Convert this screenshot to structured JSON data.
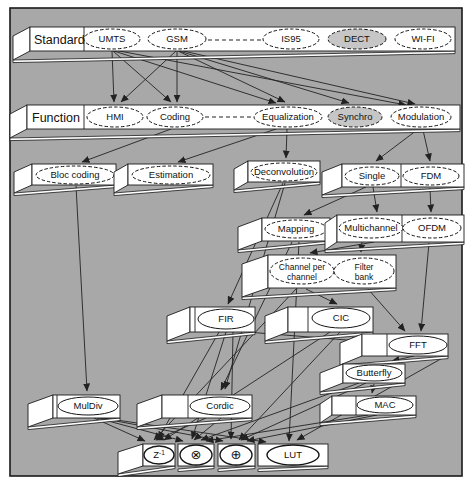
{
  "figure": {
    "panel": {
      "x": 10,
      "y": 8,
      "w": 452,
      "h": 468,
      "fill": "#a8a8a8",
      "border": "#1a1a1a"
    },
    "colors": {
      "bar_fill": "#ffffff",
      "bar_border": "#1c1c1c",
      "node_fill": "#ffffff",
      "node_shaded": "#c6c6c6",
      "line": "#222222"
    },
    "bars": [
      {
        "name": "standard-band",
        "label": "Standard",
        "label_x": 34,
        "x": 30,
        "y": 27,
        "w": 425,
        "h": 24,
        "flap": [
          17,
          9
        ],
        "dividers": [
          84
        ],
        "nodes": [
          {
            "name": "umts",
            "label": "UMTS",
            "cx": 112,
            "cy": 39,
            "rx": 28,
            "ry": 10,
            "dashed": true
          },
          {
            "name": "gsm",
            "label": "GSM",
            "cx": 177,
            "cy": 39,
            "rx": 29,
            "ry": 10,
            "dashed": true
          },
          {
            "name": "is95",
            "label": "IS95",
            "cx": 291,
            "cy": 39,
            "rx": 28,
            "ry": 10,
            "dashed": true
          },
          {
            "name": "dect",
            "label": "DECT",
            "cx": 357,
            "cy": 39,
            "rx": 29,
            "ry": 10,
            "dashed": true,
            "shaded": true
          },
          {
            "name": "wifi",
            "label": "WI-FI",
            "cx": 423,
            "cy": 39,
            "rx": 28,
            "ry": 10,
            "dashed": true
          }
        ]
      },
      {
        "name": "function-band",
        "label": "Function",
        "label_x": 32,
        "x": 27,
        "y": 105,
        "w": 433,
        "h": 24,
        "flap": [
          17,
          9
        ],
        "dividers": [
          84
        ],
        "nodes": [
          {
            "name": "hmi",
            "label": "HMI",
            "cx": 115,
            "cy": 117,
            "rx": 28,
            "ry": 10,
            "dashed": true
          },
          {
            "name": "coding",
            "label": "Coding",
            "cx": 175,
            "cy": 117,
            "rx": 28,
            "ry": 10,
            "dashed": true
          },
          {
            "name": "equalization",
            "label": "Equalization",
            "cx": 288,
            "cy": 117,
            "rx": 34,
            "ry": 10,
            "dashed": true
          },
          {
            "name": "synchro",
            "label": "Synchro",
            "cx": 355,
            "cy": 117,
            "rx": 27,
            "ry": 10,
            "dashed": true,
            "shaded": true
          },
          {
            "name": "modulation",
            "label": "Modulation",
            "cx": 421,
            "cy": 117,
            "rx": 30,
            "ry": 10,
            "dashed": true
          }
        ]
      },
      {
        "name": "bar-bloc-coding",
        "x": 32,
        "y": 164,
        "w": 84,
        "h": 21,
        "flap": [
          18,
          8
        ],
        "nodes": [
          {
            "name": "bloc-coding",
            "label": "Bloc coding",
            "cx": 75,
            "cy": 175,
            "rx": 39,
            "ry": 9,
            "dashed": true
          }
        ]
      },
      {
        "name": "bar-estimation",
        "x": 128,
        "y": 164,
        "w": 85,
        "h": 21,
        "flap": [
          14,
          8
        ],
        "nodes": [
          {
            "name": "estimation",
            "label": "Estimation",
            "cx": 171,
            "cy": 175,
            "rx": 39,
            "ry": 9,
            "dashed": true
          }
        ]
      },
      {
        "name": "bar-deconvolution",
        "x": 248,
        "y": 161,
        "w": 72,
        "h": 21,
        "flap": [
          14,
          8
        ],
        "nodes": [
          {
            "name": "deconvolution",
            "label": "Deconvolution",
            "cx": 284,
            "cy": 172,
            "rx": 33,
            "ry": 9,
            "dashed": true
          }
        ]
      },
      {
        "name": "bar-single-fdm",
        "x": 342,
        "y": 164,
        "w": 122,
        "h": 23,
        "flap": [
          20,
          8
        ],
        "dividers": [
          401
        ],
        "nodes": [
          {
            "name": "single",
            "label": "Single",
            "cx": 372,
            "cy": 176,
            "rx": 27,
            "ry": 9,
            "dashed": true
          },
          {
            "name": "fdm",
            "label": "FDM",
            "cx": 431,
            "cy": 176,
            "rx": 28,
            "ry": 9,
            "dashed": true
          }
        ]
      },
      {
        "name": "bar-mapping",
        "x": 262,
        "y": 218,
        "w": 68,
        "h": 23,
        "flap": [
          24,
          9
        ],
        "nodes": [
          {
            "name": "mapping",
            "label": "Mapping",
            "cx": 296,
            "cy": 229,
            "rx": 31,
            "ry": 9,
            "dashed": true
          }
        ]
      },
      {
        "name": "bar-multichannel-ofdm",
        "x": 337,
        "y": 215,
        "w": 127,
        "h": 27,
        "flap": [
          12,
          8
        ],
        "dividers": [
          402
        ],
        "nodes": [
          {
            "name": "multichannel",
            "label": "Multichannel",
            "cx": 371,
            "cy": 228,
            "rx": 32,
            "ry": 10,
            "dashed": true
          },
          {
            "name": "ofdm",
            "label": "OFDM",
            "cx": 432,
            "cy": 228,
            "rx": 29,
            "ry": 10,
            "dashed": true
          }
        ]
      },
      {
        "name": "bar-channel-filter",
        "x": 268,
        "y": 255,
        "w": 128,
        "h": 33,
        "flap": [
          26,
          9
        ],
        "nodes": [
          {
            "name": "channel-per-channel",
            "label": "Channel per",
            "label2": "channel",
            "cx": 302,
            "cy": 271,
            "rx": 32,
            "ry": 13,
            "dashed": true
          },
          {
            "name": "filter-bank",
            "label": "Filter",
            "label2": "bank",
            "cx": 364,
            "cy": 271,
            "rx": 30,
            "ry": 13,
            "dashed": true
          }
        ]
      },
      {
        "name": "bar-fir",
        "x": 190,
        "y": 307,
        "w": 65,
        "h": 25,
        "flap": [
          23,
          9
        ],
        "dividers": [
          195
        ],
        "nodes": [
          {
            "name": "fir",
            "label": "FIR",
            "cx": 226,
            "cy": 319,
            "rx": 28,
            "ry": 10
          }
        ]
      },
      {
        "name": "bar-cic",
        "x": 288,
        "y": 307,
        "w": 85,
        "h": 25,
        "flap": [
          23,
          9
        ],
        "dividers": [
          308
        ],
        "nodes": [
          {
            "name": "cic",
            "label": "CIC",
            "cx": 341,
            "cy": 318,
            "rx": 29,
            "ry": 10
          }
        ]
      },
      {
        "name": "bar-fft",
        "x": 362,
        "y": 334,
        "w": 86,
        "h": 22,
        "flap": [
          22,
          9
        ],
        "dividers": [
          387
        ],
        "nodes": [
          {
            "name": "fft",
            "label": "FFT",
            "cx": 418,
            "cy": 345,
            "rx": 29,
            "ry": 9
          }
        ]
      },
      {
        "name": "bar-butterfly",
        "x": 343,
        "y": 364,
        "w": 62,
        "h": 19,
        "flap": [
          23,
          9
        ],
        "nodes": [
          {
            "name": "butterfly",
            "label": "Butterfly",
            "cx": 374,
            "cy": 373,
            "rx": 28,
            "ry": 8
          }
        ]
      },
      {
        "name": "bar-mac",
        "x": 332,
        "y": 396,
        "w": 84,
        "h": 19,
        "flap": [
          12,
          8
        ],
        "dividers": [
          356
        ],
        "nodes": [
          {
            "name": "mac",
            "label": "MAC",
            "cx": 385,
            "cy": 405,
            "rx": 28,
            "ry": 8
          }
        ]
      },
      {
        "name": "bar-muldiv",
        "x": 53,
        "y": 395,
        "w": 67,
        "h": 23,
        "flap": [
          25,
          9
        ],
        "dividers": [
          57
        ],
        "nodes": [
          {
            "name": "muldiv",
            "label": "MulDiv",
            "cx": 88,
            "cy": 406,
            "rx": 30,
            "ry": 9
          }
        ]
      },
      {
        "name": "bar-cordic",
        "x": 162,
        "y": 395,
        "w": 90,
        "h": 23,
        "flap": [
          25,
          9
        ],
        "dividers": [
          188
        ],
        "nodes": [
          {
            "name": "cordic",
            "label": "Cordic",
            "cx": 220,
            "cy": 406,
            "rx": 30,
            "ry": 9
          }
        ]
      },
      {
        "name": "bar-z1",
        "x": 143,
        "y": 444,
        "w": 32,
        "h": 22,
        "flap": [
          25,
          8
        ],
        "nodes": [
          {
            "name": "z1",
            "label": "Z",
            "sup": "-1",
            "cx": 159,
            "cy": 455,
            "rx": 15,
            "ry": 9,
            "thick": true
          }
        ]
      },
      {
        "name": "bar-otimes",
        "x": 178,
        "y": 444,
        "w": 36,
        "h": 22,
        "nodes": [
          {
            "name": "otimes",
            "label": "⊗",
            "cx": 196,
            "cy": 455,
            "rx": 16,
            "ry": 10,
            "thick": true,
            "sym": true
          }
        ]
      },
      {
        "name": "bar-oplus",
        "x": 218,
        "y": 444,
        "w": 37,
        "h": 22,
        "nodes": [
          {
            "name": "oplus",
            "label": "⊕",
            "cx": 236,
            "cy": 455,
            "rx": 16,
            "ry": 10,
            "thick": true,
            "sym": true
          }
        ]
      },
      {
        "name": "bar-lut",
        "x": 258,
        "y": 444,
        "w": 70,
        "h": 22,
        "nodes": [
          {
            "name": "lut",
            "label": "LUT",
            "cx": 293,
            "cy": 455,
            "rx": 26,
            "ry": 10,
            "thick": true
          }
        ]
      }
    ],
    "dashed_links": [
      {
        "name": "standard-ellipsis",
        "x1": 208,
        "y1": 40,
        "x2": 261,
        "y2": 40
      },
      {
        "name": "function-ellipsis",
        "x1": 205,
        "y1": 117,
        "x2": 252,
        "y2": 117
      }
    ],
    "edges": [
      {
        "from": "umts",
        "to": "hmi",
        "x1": 112,
        "y1": 51,
        "x2": 114,
        "y2": 102
      },
      {
        "from": "umts",
        "to": "coding",
        "x1": 113,
        "y1": 51,
        "x2": 171,
        "y2": 102
      },
      {
        "from": "umts",
        "to": "equalization",
        "x1": 114,
        "y1": 51,
        "x2": 276,
        "y2": 103
      },
      {
        "from": "umts",
        "to": "modulation",
        "x1": 114,
        "y1": 50,
        "x2": 406,
        "y2": 105
      },
      {
        "from": "gsm",
        "to": "hmi",
        "x1": 176,
        "y1": 51,
        "x2": 121,
        "y2": 102
      },
      {
        "from": "gsm",
        "to": "coding",
        "x1": 177,
        "y1": 51,
        "x2": 177,
        "y2": 102
      },
      {
        "from": "gsm",
        "to": "equalization",
        "x1": 178,
        "y1": 51,
        "x2": 285,
        "y2": 102
      },
      {
        "from": "gsm",
        "to": "synchro",
        "x1": 179,
        "y1": 51,
        "x2": 349,
        "y2": 103
      },
      {
        "from": "gsm",
        "to": "modulation",
        "x1": 179,
        "y1": 50,
        "x2": 415,
        "y2": 104
      },
      {
        "from": "coding",
        "to": "bloc-coding",
        "x1": 171,
        "y1": 129,
        "x2": 82,
        "y2": 162
      },
      {
        "from": "equalization",
        "to": "estimation",
        "x1": 276,
        "y1": 129,
        "x2": 178,
        "y2": 162
      },
      {
        "from": "equalization",
        "to": "deconvolution",
        "x1": 287,
        "y1": 129,
        "x2": 286,
        "y2": 158
      },
      {
        "from": "modulation",
        "to": "single",
        "x1": 417,
        "y1": 130,
        "x2": 376,
        "y2": 161
      },
      {
        "from": "modulation",
        "to": "fdm",
        "x1": 423,
        "y1": 130,
        "x2": 430,
        "y2": 161
      },
      {
        "from": "single",
        "to": "mapping",
        "x1": 366,
        "y1": 187,
        "x2": 304,
        "y2": 215
      },
      {
        "from": "single",
        "to": "multichannel",
        "x1": 373,
        "y1": 187,
        "x2": 377,
        "y2": 212
      },
      {
        "from": "fdm",
        "to": "ofdm",
        "x1": 430,
        "y1": 188,
        "x2": 431,
        "y2": 212
      },
      {
        "from": "multichannel",
        "to": "channel-per-channel",
        "x1": 374,
        "y1": 242,
        "x2": 310,
        "y2": 253
      },
      {
        "from": "multichannel",
        "to": "filter-bank",
        "x1": 362,
        "y1": 242,
        "x2": 361,
        "y2": 252
      },
      {
        "from": "deconvolution",
        "to": "fir",
        "x1": 283,
        "y1": 183,
        "x2": 228,
        "y2": 304
      },
      {
        "from": "channel-per-channel",
        "to": "cic",
        "x1": 306,
        "y1": 289,
        "x2": 337,
        "y2": 304
      },
      {
        "from": "filter-bank",
        "to": "fft",
        "x1": 368,
        "y1": 289,
        "x2": 405,
        "y2": 331
      },
      {
        "from": "ofdm",
        "to": "fft",
        "x1": 429,
        "y1": 243,
        "x2": 421,
        "y2": 331
      },
      {
        "from": "fir",
        "to": "fft",
        "x1": 247,
        "y1": 332,
        "x2": 359,
        "y2": 341
      },
      {
        "from": "fft",
        "to": "butterfly",
        "x1": 414,
        "y1": 356,
        "x2": 392,
        "y2": 361
      },
      {
        "from": "butterfly",
        "to": "mac",
        "x1": 374,
        "y1": 384,
        "x2": 372,
        "y2": 393
      },
      {
        "from": "bloc-coding",
        "to": "muldiv",
        "x1": 76,
        "y1": 186,
        "x2": 87,
        "y2": 391
      },
      {
        "from": "deconvolution",
        "to": "cordic",
        "x1": 285,
        "y1": 183,
        "x2": 225,
        "y2": 389
      },
      {
        "from": "mapping",
        "to": "cordic",
        "x1": 292,
        "y1": 242,
        "x2": 221,
        "y2": 390
      },
      {
        "from": "channel-per-channel",
        "to": "z1",
        "x1": 296,
        "y1": 289,
        "x2": 154,
        "y2": 440
      },
      {
        "from": "mapping",
        "to": "lut",
        "x1": 299,
        "y1": 242,
        "x2": 289,
        "y2": 441
      },
      {
        "from": "muldiv",
        "to": "z1",
        "x1": 94,
        "y1": 418,
        "x2": 145,
        "y2": 441
      },
      {
        "from": "muldiv",
        "to": "otimes",
        "x1": 97,
        "y1": 418,
        "x2": 183,
        "y2": 441
      },
      {
        "from": "muldiv",
        "to": "oplus",
        "x1": 100,
        "y1": 418,
        "x2": 223,
        "y2": 441
      },
      {
        "from": "muldiv",
        "to": "lut",
        "x1": 103,
        "y1": 418,
        "x2": 266,
        "y2": 442
      },
      {
        "from": "cordic",
        "to": "z1",
        "x1": 206,
        "y1": 418,
        "x2": 156,
        "y2": 440
      },
      {
        "from": "cordic",
        "to": "otimes",
        "x1": 221,
        "y1": 418,
        "x2": 194,
        "y2": 440
      },
      {
        "from": "fir",
        "to": "z1",
        "x1": 219,
        "y1": 332,
        "x2": 158,
        "y2": 439
      },
      {
        "from": "fir",
        "to": "otimes",
        "x1": 226,
        "y1": 332,
        "x2": 192,
        "y2": 439
      },
      {
        "from": "fir",
        "to": "oplus",
        "x1": 233,
        "y1": 332,
        "x2": 231,
        "y2": 439
      },
      {
        "from": "cic",
        "to": "z1",
        "x1": 330,
        "y1": 332,
        "x2": 164,
        "y2": 440
      },
      {
        "from": "cic",
        "to": "oplus",
        "x1": 340,
        "y1": 332,
        "x2": 239,
        "y2": 440
      },
      {
        "from": "butterfly",
        "to": "otimes",
        "x1": 359,
        "y1": 383,
        "x2": 201,
        "y2": 440
      },
      {
        "from": "butterfly",
        "to": "oplus",
        "x1": 366,
        "y1": 383,
        "x2": 241,
        "y2": 440
      },
      {
        "from": "mac",
        "to": "otimes",
        "x1": 368,
        "y1": 415,
        "x2": 206,
        "y2": 441
      },
      {
        "from": "mac",
        "to": "oplus",
        "x1": 377,
        "y1": 415,
        "x2": 247,
        "y2": 441
      },
      {
        "from": "fft",
        "to": "lut",
        "x1": 446,
        "y1": 356,
        "x2": 297,
        "y2": 440
      }
    ]
  }
}
